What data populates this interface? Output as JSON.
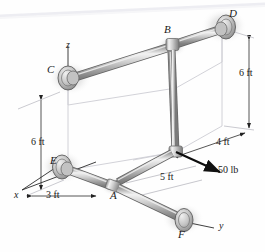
{
  "figure": {
    "background_color": "#fefefe",
    "line_color": "#1a1a1a",
    "pipe_fill": "#c9c9c9",
    "pipe_highlight": "#efefef",
    "pipe_shadow": "#8f8f8f",
    "construction_line_color": "#c8c8cf",
    "shadow_color": "#b9b9b9"
  },
  "axes": [
    {
      "name": "z",
      "label": "z",
      "x": 66,
      "y": 40
    },
    {
      "name": "x",
      "label": "x",
      "x": 14,
      "y": 190
    },
    {
      "name": "y",
      "label": "y",
      "x": 219,
      "y": 221
    }
  ],
  "joints": [
    {
      "name": "B",
      "label": "B",
      "x": 164,
      "y": 24
    },
    {
      "name": "D",
      "label": "D",
      "x": 229,
      "y": 8
    },
    {
      "name": "C",
      "label": "C",
      "x": 47,
      "y": 64
    },
    {
      "name": "E",
      "label": "E",
      "x": 50,
      "y": 155
    },
    {
      "name": "A",
      "label": "A",
      "x": 110,
      "y": 190
    },
    {
      "name": "F",
      "label": "F",
      "x": 178,
      "y": 229
    }
  ],
  "dimensions": [
    {
      "name": "height-left",
      "label": "6 ft",
      "x": 31,
      "y": 137
    },
    {
      "name": "height-right",
      "label": "6 ft",
      "x": 239,
      "y": 68
    },
    {
      "name": "depth",
      "label": "4 ft",
      "x": 216,
      "y": 137
    },
    {
      "name": "span",
      "label": "5 ft",
      "x": 160,
      "y": 172
    },
    {
      "name": "offset",
      "label": "3 ft",
      "x": 46,
      "y": 190
    }
  ],
  "load": {
    "name": "applied-force",
    "label": "50 lb",
    "magnitude": 50,
    "unit": "lb",
    "label_x": 218,
    "label_y": 165,
    "tail": {
      "x": 176,
      "y": 152
    },
    "head": {
      "x": 222,
      "y": 173
    }
  }
}
